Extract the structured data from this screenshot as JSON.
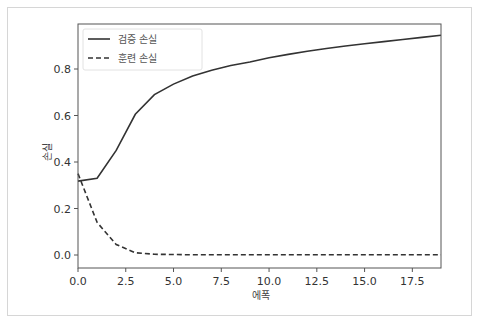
{
  "chart_data": {
    "type": "line",
    "title": "",
    "xlabel": "에폭",
    "ylabel": "손실",
    "xlim": [
      0,
      19
    ],
    "ylim": [
      -0.03,
      0.99
    ],
    "grid": false,
    "legend_position": "upper left",
    "x": [
      0,
      1,
      2,
      3,
      4,
      5,
      6,
      7,
      8,
      9,
      10,
      11,
      12,
      13,
      14,
      15,
      16,
      17,
      18,
      19
    ],
    "series": [
      {
        "name": "검증 손실",
        "style": "solid",
        "values": [
          0.318,
          0.33,
          0.45,
          0.605,
          0.69,
          0.735,
          0.77,
          0.795,
          0.815,
          0.83,
          0.848,
          0.863,
          0.876,
          0.888,
          0.899,
          0.909,
          0.918,
          0.927,
          0.936,
          0.945
        ]
      },
      {
        "name": "훈련 손실",
        "style": "dashed",
        "values": [
          0.35,
          0.14,
          0.045,
          0.01,
          0.003,
          0.002,
          0.001,
          0.001,
          0.001,
          0.001,
          0.001,
          0.001,
          0.001,
          0.001,
          0.001,
          0.001,
          0.001,
          0.001,
          0.001,
          0.001
        ]
      }
    ],
    "xticks": [
      "0.0",
      "2.5",
      "5.0",
      "7.5",
      "10.0",
      "12.5",
      "15.0",
      "17.5"
    ],
    "yticks": [
      "0.0",
      "0.2",
      "0.4",
      "0.6",
      "0.8"
    ]
  },
  "legend": {
    "items": [
      "검증 손실",
      "훈련 손실"
    ]
  },
  "colors": {
    "line": "#333333",
    "axis": "#555555",
    "frame": "#d6d6d6"
  }
}
